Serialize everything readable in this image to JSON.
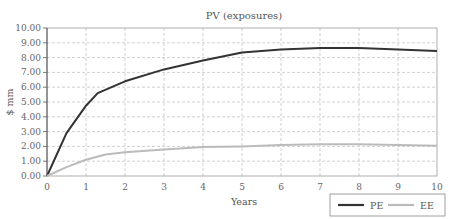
{
  "chart_data": {
    "type": "line",
    "title": "PV (exposures)",
    "xlabel": "Years",
    "ylabel": "$ mm",
    "xlim": [
      0,
      10
    ],
    "ylim": [
      0,
      10
    ],
    "x_ticks": [
      "0",
      "1",
      "2",
      "3",
      "4",
      "5",
      "6",
      "7",
      "8",
      "9",
      "10"
    ],
    "y_ticks": [
      "0.00",
      "1.00",
      "2.00",
      "3.00",
      "4.00",
      "5.00",
      "6.00",
      "7.00",
      "8.00",
      "9.00",
      "10.00"
    ],
    "grid": true,
    "legend_position": "bottom-right",
    "series": [
      {
        "name": "PE",
        "color": "#333333",
        "x": [
          0,
          0.5,
          1,
          1.3,
          2,
          3,
          4,
          5,
          6,
          7,
          7.6,
          8,
          9,
          10
        ],
        "values": [
          0,
          2.9,
          4.75,
          5.6,
          6.4,
          7.2,
          7.8,
          8.35,
          8.55,
          8.65,
          8.65,
          8.65,
          8.55,
          8.45
        ]
      },
      {
        "name": "EE",
        "color": "#bbbbbb",
        "x": [
          0,
          0.5,
          1,
          1.5,
          2,
          3,
          4,
          5,
          6,
          7,
          8,
          9,
          10
        ],
        "values": [
          0,
          0.6,
          1.1,
          1.45,
          1.6,
          1.8,
          1.95,
          2.0,
          2.1,
          2.15,
          2.15,
          2.1,
          2.05
        ]
      }
    ]
  }
}
